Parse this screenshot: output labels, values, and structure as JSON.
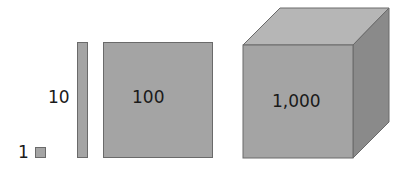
{
  "diagram": {
    "title": "",
    "items": [
      {
        "id": "unit",
        "label": "1",
        "shape": "small square"
      },
      {
        "id": "rod",
        "label": "10",
        "shape": "rod"
      },
      {
        "id": "flat",
        "label": "100",
        "shape": "square"
      },
      {
        "id": "cube",
        "label": "1,000",
        "shape": "cube"
      }
    ],
    "colors": {
      "front": "#a4a4a4",
      "top": "#b6b6b6",
      "side": "#8a8a8a",
      "edge": "#6a6a6a",
      "text": "#1a1a1a"
    }
  }
}
